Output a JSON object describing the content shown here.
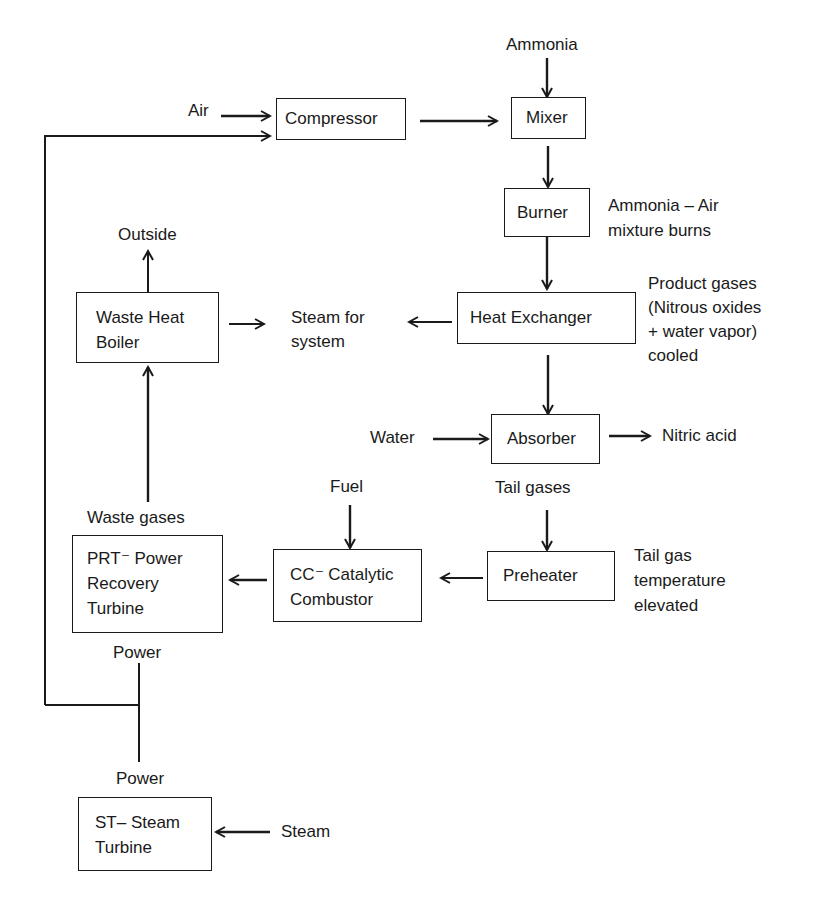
{
  "diagram": {
    "type": "process-flow",
    "blocks": {
      "compressor": "Compressor",
      "mixer": "Mixer",
      "burner": "Burner",
      "heat_exchanger": "Heat Exchanger",
      "waste_heat_boiler": "Waste Heat\nBoiler",
      "absorber": "Absorber",
      "preheater": "Preheater",
      "catalytic_combustor": "CC⁻ Catalytic\nCombustor",
      "power_recovery_turbine": "PRT⁻ Power\nRecovery\nTurbine",
      "steam_turbine": "ST– Steam\nTurbine"
    },
    "labels": {
      "ammonia": "Ammonia",
      "air": "Air",
      "ammonia_air_note": "Ammonia – Air\nmixture burns",
      "outside": "Outside",
      "steam_for_system": "Steam for\nsystem",
      "product_gases_note": "Product gases\n(Nitrous oxides\n+ water vapor)\ncooled",
      "water": "Water",
      "nitric_acid": "Nitric acid",
      "tail_gases": "Tail gases",
      "fuel": "Fuel",
      "waste_gases": "Waste gases",
      "tail_gas_note": "Tail gas\ntemperature\nelevated",
      "power_prt": "Power",
      "power_st": "Power",
      "steam": "Steam"
    },
    "edges": [
      {
        "from": "Air",
        "to": "Compressor"
      },
      {
        "from": "Power (PRT/ST)",
        "to": "Compressor"
      },
      {
        "from": "Compressor",
        "to": "Mixer"
      },
      {
        "from": "Ammonia",
        "to": "Mixer"
      },
      {
        "from": "Mixer",
        "to": "Burner"
      },
      {
        "from": "Burner",
        "to": "Heat Exchanger"
      },
      {
        "from": "Heat Exchanger",
        "to": "Steam for system"
      },
      {
        "from": "Waste Heat Boiler",
        "to": "Steam for system"
      },
      {
        "from": "Waste Heat Boiler",
        "to": "Outside"
      },
      {
        "from": "Heat Exchanger",
        "to": "Absorber"
      },
      {
        "from": "Water",
        "to": "Absorber"
      },
      {
        "from": "Absorber",
        "to": "Nitric acid"
      },
      {
        "from": "Absorber",
        "to": "Preheater"
      },
      {
        "from": "Preheater",
        "to": "CC - Catalytic Combustor"
      },
      {
        "from": "Fuel",
        "to": "CC - Catalytic Combustor"
      },
      {
        "from": "CC - Catalytic Combustor",
        "to": "PRT - Power Recovery Turbine"
      },
      {
        "from": "PRT - Power Recovery Turbine",
        "to": "Waste Heat Boiler"
      },
      {
        "from": "Steam",
        "to": "ST - Steam Turbine"
      }
    ],
    "colors": {
      "line": "#1a1a1a",
      "background": "#ffffff"
    }
  }
}
